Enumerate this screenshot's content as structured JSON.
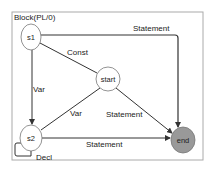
{
  "diagram": {
    "title": "Block(PL/0)",
    "colors": {
      "frame": "#aaaaaa",
      "edge": "#333333",
      "node_stroke": "#777777",
      "node_fill": "#ffffff",
      "end_fill": "#999999"
    },
    "nodes": [
      {
        "id": "s1",
        "label": "s1",
        "cx": 31,
        "cy": 37,
        "rx": 10,
        "ry": 13
      },
      {
        "id": "start",
        "label": "start",
        "cx": 108,
        "cy": 79,
        "rx": 12,
        "ry": 12
      },
      {
        "id": "s2",
        "label": "s2",
        "cx": 31,
        "cy": 138,
        "rx": 11,
        "ry": 13
      },
      {
        "id": "end",
        "label": "end",
        "cx": 183,
        "cy": 140,
        "rx": 12,
        "ry": 13,
        "filled": true
      }
    ],
    "edges": [
      {
        "from": "s1",
        "to": "end",
        "label": "Statement"
      },
      {
        "from": "s1",
        "to": "start",
        "label": "Const"
      },
      {
        "from": "s1",
        "to": "s2",
        "label": "Var"
      },
      {
        "from": "start",
        "to": "s2",
        "label": "Var"
      },
      {
        "from": "start",
        "to": "end",
        "label": "Statement"
      },
      {
        "from": "s2",
        "to": "end",
        "label": "Statement"
      },
      {
        "from": "s2",
        "to": "s2",
        "label": "Decl"
      }
    ]
  }
}
